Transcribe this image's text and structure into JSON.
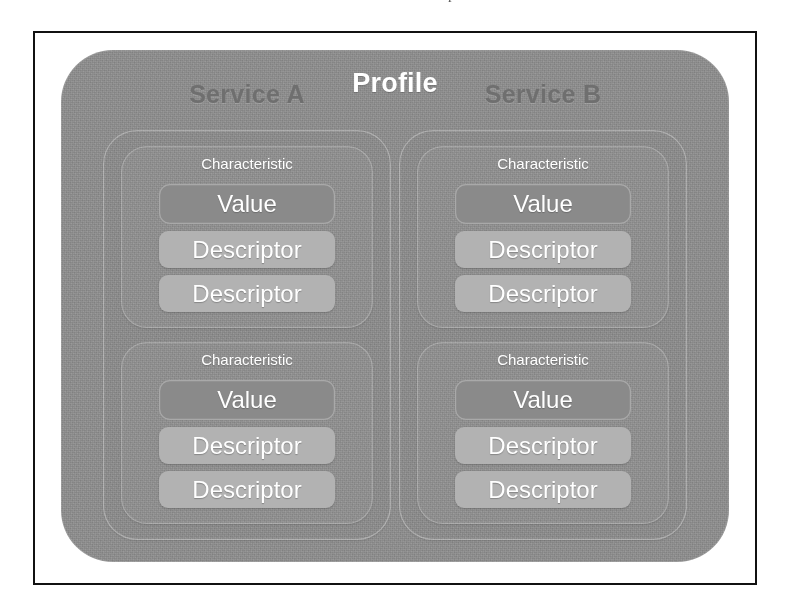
{
  "page": {
    "artifact_glyphs": [
      "o",
      "p",
      "o",
      "o"
    ]
  },
  "figure": {
    "title": "Profile",
    "services": [
      {
        "label": "Service A",
        "characteristics": [
          {
            "label": "Characteristic",
            "value": {
              "label": "Value"
            },
            "descriptors": [
              {
                "label": "Descriptor"
              },
              {
                "label": "Descriptor"
              }
            ]
          },
          {
            "label": "Characteristic",
            "value": {
              "label": "Value"
            },
            "descriptors": [
              {
                "label": "Descriptor"
              },
              {
                "label": "Descriptor"
              }
            ]
          }
        ]
      },
      {
        "label": "Service B",
        "characteristics": [
          {
            "label": "Characteristic",
            "value": {
              "label": "Value"
            },
            "descriptors": [
              {
                "label": "Descriptor"
              },
              {
                "label": "Descriptor"
              }
            ]
          },
          {
            "label": "Characteristic",
            "value": {
              "label": "Value"
            },
            "descriptors": [
              {
                "label": "Descriptor"
              },
              {
                "label": "Descriptor"
              }
            ]
          }
        ]
      }
    ]
  },
  "colors": {
    "frame_border": "#111111",
    "page_background": "#ffffff",
    "profile_panel": "#8d8d8d",
    "service_panel": "#8b8b8b",
    "characteristic_panel": "#8f8f8f",
    "value_box": "#8a8a8a",
    "descriptor_box": "#b2b2b2",
    "title_text": "#ffffff",
    "service_label_text": "#6f6f6f",
    "box_label_text": "#ffffff"
  }
}
